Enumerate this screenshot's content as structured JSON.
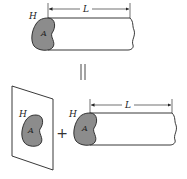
{
  "diagram": {
    "top": {
      "face_label": "H",
      "area_label": "A",
      "length_label": "L"
    },
    "equals_symbol": "||",
    "bottom": {
      "plane": {
        "face_label": "H",
        "area_label": "A"
      },
      "plus_symbol": "+",
      "cylinder": {
        "face_label": "H",
        "area_label": "A",
        "length_label": "L"
      }
    },
    "colors": {
      "cross_section_fill": "#8c8c8c",
      "stroke": "#222222",
      "background": "#ffffff"
    }
  }
}
